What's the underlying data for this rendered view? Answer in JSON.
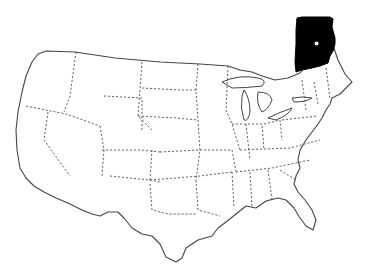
{
  "map": {
    "type": "outline-locator-map",
    "region": "United States (contiguous)",
    "background": "#ffffff",
    "outline_color": "#444444",
    "state_border_style": "dashed",
    "highlight": {
      "shape": "inset locator (black)",
      "position": "upper right, above northeast US",
      "fill": "#000000",
      "marker": "white dot"
    }
  }
}
